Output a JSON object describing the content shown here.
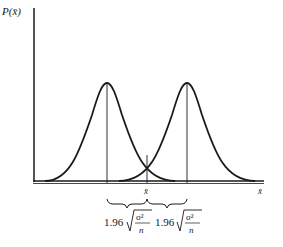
{
  "diagram": {
    "y_axis_label": "P(x̄)",
    "x_axis_label": "x̄",
    "center_label": "x̄",
    "curves": [
      {
        "name": "left-normal-curve",
        "peak_x": 107
      },
      {
        "name": "right-normal-curve",
        "peak_x": 187
      }
    ],
    "annotations": {
      "left_interval": {
        "coef": "1.96",
        "numerator": "σ²",
        "denominator": "n"
      },
      "right_interval": {
        "coef": "1.96",
        "numerator": "σ²",
        "denominator": "n"
      }
    },
    "colors": {
      "stroke": "#1a1a1a",
      "background": "#ffffff"
    }
  }
}
